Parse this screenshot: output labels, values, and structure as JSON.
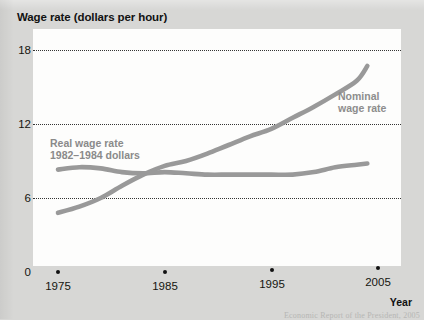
{
  "chart_title": "Wage rate (dollars per hour)",
  "axis": {
    "x_name": "Year",
    "y_ticks": [
      "18",
      "12",
      "6",
      "0"
    ],
    "x_ticks": [
      "1975",
      "1985",
      "1995",
      "2005"
    ]
  },
  "labels": {
    "nominal_line1": "Nominal",
    "nominal_line2": "wage rate",
    "real_line1": "Real wage rate",
    "real_line2": "1982–1984 dollars"
  },
  "source_note": "Economic Report of the President, 2005",
  "colors": {
    "line": "#999999",
    "plot_background": "#fdfdfc",
    "page_background": "#d7d7d5",
    "text": "#15150f"
  },
  "chart_data": {
    "type": "line",
    "title": "Wage rate (dollars per hour)",
    "xlabel": "Year",
    "ylabel": "Wage rate (dollars per hour)",
    "xlim": [
      1975,
      2005
    ],
    "ylim": [
      0,
      18
    ],
    "yticks": [
      0,
      6,
      12,
      18
    ],
    "xticks": [
      1975,
      1985,
      1995,
      2005
    ],
    "grid": "horizontal-dotted",
    "legend": "inline-annotations",
    "x": [
      1975,
      1977,
      1979,
      1981,
      1983,
      1985,
      1987,
      1989,
      1991,
      1993,
      1995,
      1997,
      1999,
      2001,
      2003,
      2004
    ],
    "series": [
      {
        "name": "Nominal wage rate",
        "label_text": "Nominal wage rate",
        "values": [
          4.8,
          5.3,
          6.0,
          7.0,
          7.9,
          8.6,
          9.0,
          9.6,
          10.3,
          11.0,
          11.6,
          12.5,
          13.4,
          14.4,
          15.5,
          16.7
        ]
      },
      {
        "name": "Real wage rate 1982-1984 dollars",
        "label_text": "Real wage rate 1982–1984 dollars",
        "values": [
          8.3,
          8.5,
          8.4,
          8.1,
          8.0,
          8.1,
          8.0,
          7.9,
          7.9,
          7.9,
          7.9,
          7.9,
          8.1,
          8.5,
          8.7,
          8.8
        ]
      }
    ]
  }
}
